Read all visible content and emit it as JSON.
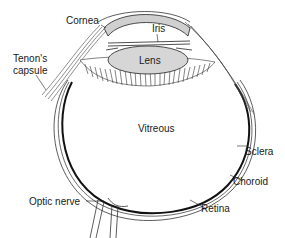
{
  "diagram": {
    "type": "anatomical cross-section",
    "labels": {
      "cornea": "Cornea",
      "iris": "Iris",
      "lens": "Lens",
      "tenons_capsule_line1": "Tenon's",
      "tenons_capsule_line2": "capsule",
      "vitreous": "Vitreous",
      "sclera": "Sclera",
      "choroid": "Choroid",
      "retina": "Retina",
      "optic_nerve": "Optic nerve"
    },
    "colors": {
      "lens_fill": "#d6d6d6",
      "cornea_fill": "#d0d0d0",
      "line": "#222222",
      "background": "#ffffff"
    }
  }
}
